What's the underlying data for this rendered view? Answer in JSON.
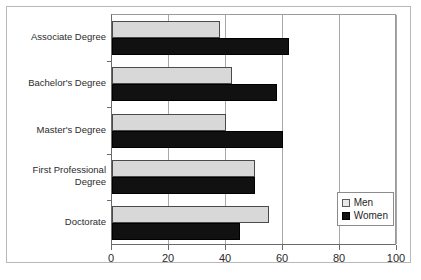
{
  "chart_data": {
    "type": "bar",
    "orientation": "horizontal",
    "title": "",
    "subtitle": "",
    "xlabel": "",
    "ylabel": "",
    "categories": [
      "Associate Degree",
      "Bachelor's Degree",
      "Master's Degree",
      "First Professional\nDegree",
      "Doctorate"
    ],
    "series": [
      {
        "name": "Men",
        "color": "#d8d8d8",
        "values": [
          38,
          42,
          40,
          50,
          55
        ]
      },
      {
        "name": "Women",
        "color": "#111111",
        "values": [
          62,
          58,
          60,
          50,
          45
        ]
      }
    ],
    "xlim": [
      0,
      100
    ],
    "xticks": [
      0,
      20,
      40,
      60,
      80,
      100
    ],
    "xticklabels": [
      "0",
      "20",
      "40",
      "60",
      "80",
      "100"
    ],
    "grid": true,
    "grid_axis": "x",
    "legend_position": "lower right",
    "legend_entries": [
      "Men",
      "Women"
    ]
  },
  "legend": {
    "men_label": "Men",
    "women_label": "Women"
  }
}
